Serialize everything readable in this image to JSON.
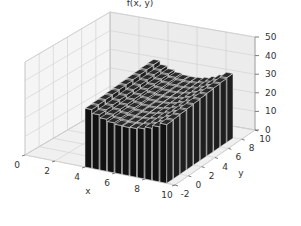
{
  "chart_data": {
    "type": "bar3d",
    "title": "",
    "xlabel": "x",
    "ylabel": "y",
    "zlabel": "f(x, y)",
    "xlim": [
      0,
      10
    ],
    "ylim": [
      -2,
      10
    ],
    "zlim": [
      0,
      50
    ],
    "x_ticks": [
      "0",
      "2",
      "4",
      "6",
      "8",
      "10"
    ],
    "y_ticks": [
      "-2",
      "0",
      "2",
      "4",
      "6",
      "8",
      "10"
    ],
    "z_ticks": [
      "0",
      "10",
      "20",
      "30",
      "40",
      "50"
    ],
    "grid": true,
    "bar_color": "#111111",
    "edge_color": "#e8e8e8",
    "grid_x": [
      4.0,
      4.5,
      5.0,
      5.5,
      6.0,
      6.5,
      7.0,
      7.5,
      8.0,
      8.5,
      9.0
    ],
    "grid_y": [
      -2.0,
      -1.0,
      0.0,
      1.0,
      2.0,
      3.0,
      4.0,
      5.0,
      6.0,
      7.0
    ],
    "surface_description": "Valley-shaped surface: heights ~33-35 at x=4 and x=9 edges, dipping to ~26-28 near x=6.5; slight rise toward back (larger y)",
    "z_min_est": 26,
    "z_max_est": 36
  },
  "labels": {
    "zlabel": "f(x, y)",
    "xlabel": "x",
    "ylabel": "y"
  }
}
